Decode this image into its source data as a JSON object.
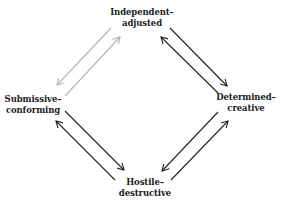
{
  "diagram": {
    "nodes": {
      "top": {
        "line1": "Independent–",
        "line2": "adjusted"
      },
      "left": {
        "line1": "Submissive–",
        "line2": "conforming"
      },
      "right": {
        "line1": "Determined–",
        "line2": "creative"
      },
      "bottom": {
        "line1": "Hostile–",
        "line2": "destructive"
      }
    },
    "colors": {
      "arrow_dark": "#222222",
      "arrow_gray": "#b4b4b4",
      "text": "#1c1c1c"
    },
    "edges": [
      {
        "from": "top",
        "to": "left",
        "color": "gray"
      },
      {
        "from": "left",
        "to": "top",
        "color": "gray"
      },
      {
        "from": "top",
        "to": "right",
        "color": "dark"
      },
      {
        "from": "right",
        "to": "top",
        "color": "dark"
      },
      {
        "from": "right",
        "to": "bottom",
        "color": "dark"
      },
      {
        "from": "bottom",
        "to": "right",
        "color": "dark"
      },
      {
        "from": "left",
        "to": "bottom",
        "color": "dark"
      },
      {
        "from": "bottom",
        "to": "left",
        "color": "dark"
      }
    ]
  }
}
